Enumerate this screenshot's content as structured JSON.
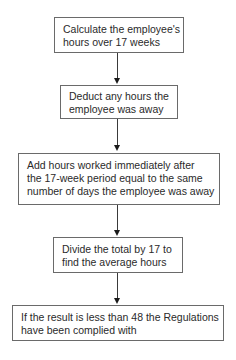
{
  "flowchart": {
    "steps": [
      {
        "lines": [
          "Calculate the employee's",
          "hours over 17 weeks"
        ]
      },
      {
        "lines": [
          "Deduct any hours the",
          "employee was away"
        ]
      },
      {
        "lines": [
          "Add hours worked immediately after",
          "the 17-week period equal to the same",
          "number of days the employee was away"
        ]
      },
      {
        "lines": [
          "Divide the total by 17 to",
          "find the average hours"
        ]
      },
      {
        "lines": [
          "If the result is less than 48 the Regulations",
          "have been complied with"
        ]
      }
    ],
    "colors": {
      "border": "#6a6a6a",
      "arrow": "#1a1a1a",
      "text": "#2a2a2a"
    }
  }
}
